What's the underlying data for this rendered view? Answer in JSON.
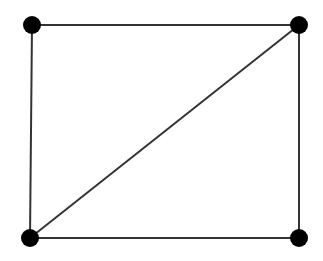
{
  "diagram": {
    "type": "graph",
    "colors": {
      "edge": "#333333",
      "node": "#000000",
      "background": "#ffffff"
    },
    "node_radius": 9,
    "edge_width": 2,
    "nodes": [
      {
        "id": "top-left",
        "x": 32,
        "y": 25
      },
      {
        "id": "top-right",
        "x": 299,
        "y": 25
      },
      {
        "id": "bottom-left",
        "x": 30,
        "y": 238
      },
      {
        "id": "bottom-right",
        "x": 299,
        "y": 238
      }
    ],
    "edges": [
      {
        "from": "top-left",
        "to": "top-right"
      },
      {
        "from": "top-right",
        "to": "bottom-right"
      },
      {
        "from": "bottom-right",
        "to": "bottom-left"
      },
      {
        "from": "bottom-left",
        "to": "top-left"
      },
      {
        "from": "bottom-left",
        "to": "top-right"
      }
    ]
  }
}
